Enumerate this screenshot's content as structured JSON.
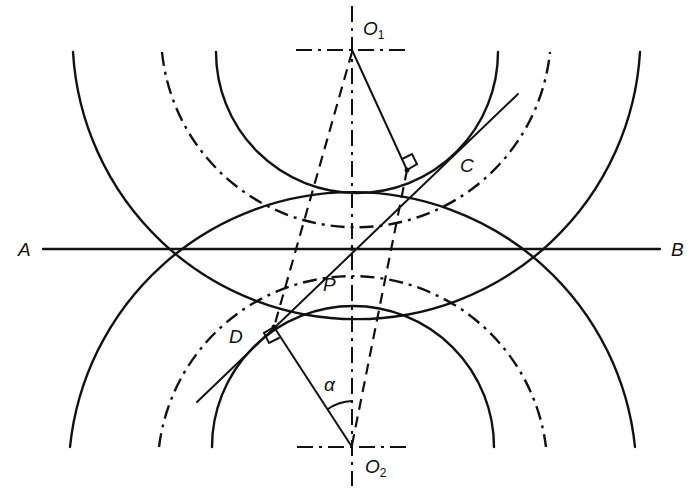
{
  "figure": {
    "type": "gear-tooth-interference-geometry",
    "labels": {
      "O1": "O",
      "O1_sub": "1",
      "O2": "O",
      "O2_sub": "2",
      "A": "A",
      "B": "B",
      "C": "C",
      "D": "D",
      "P": "P",
      "alpha": "α"
    },
    "points": {
      "O1": [
        352,
        50
      ],
      "O2": [
        352,
        447
      ],
      "P": [
        352,
        249
      ],
      "C": [
        407,
        170
      ],
      "D": [
        274,
        327
      ],
      "A_end": [
        43,
        249
      ],
      "B_end": [
        660,
        249
      ]
    },
    "upper_gear_circles": {
      "center": "O1",
      "root_radius": 138,
      "pitch_radius": 195,
      "addendum_radius": 284
    },
    "lower_gear_circles": {
      "center": "O2",
      "root_radius": 138,
      "pitch_radius": 195,
      "addendum_radius": 284
    },
    "colors": {
      "line": "#111111",
      "background": "#ffffff"
    }
  }
}
